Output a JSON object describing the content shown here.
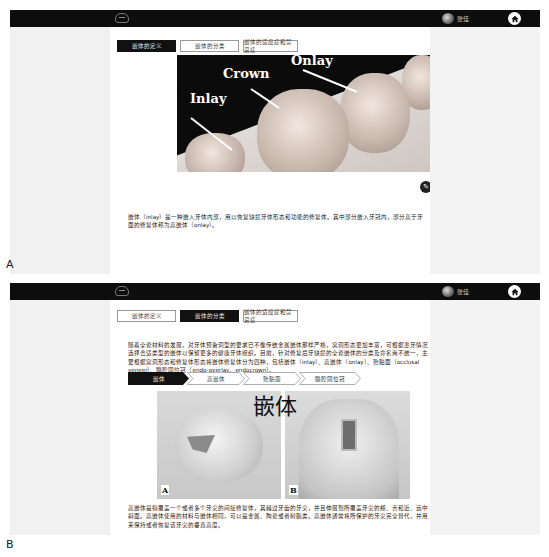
{
  "panels": [
    {
      "letter": "A",
      "header": {
        "user_name": "张佳",
        "logo": "tooth-logo-icon",
        "home": "home-icon"
      },
      "tabs": [
        {
          "label": "嵌体的定义",
          "active": true
        },
        {
          "label": "嵌体的分类",
          "active": false
        },
        {
          "label": "嵌体的适应症和禁忌症",
          "active": false
        }
      ],
      "image": {
        "labels": [
          "Inlay",
          "Crown",
          "Onlay"
        ]
      },
      "edit_icon": "pencil-icon",
      "paragraph": "嵌体（inlay）是一种嵌入牙体内部，用以恢复缺损牙体形态和功能的修复体。其中部分嵌入牙冠内，部分高于牙面的修复体称为高嵌体（onlay）。"
    },
    {
      "letter": "B",
      "header": {
        "user_name": "张佳",
        "logo": "tooth-logo-icon",
        "home": "home-icon"
      },
      "tabs": [
        {
          "label": "嵌体的定义",
          "active": false
        },
        {
          "label": "嵌体的分类",
          "active": true
        },
        {
          "label": "嵌体的适应症和禁忌症",
          "active": false
        }
      ],
      "intro": "随着全瓷材料的发展，对牙体预备洞型的要求已不像传统金属嵌体那样严格，窝洞形态更加丰富，可根据患牙情况选择合适类型的嵌体以保留更多的健康牙体组织。目前，针对修复后牙缺损的全瓷嵌体的分类及命名尚不统一，主要根据窝洞形态和修复体形态将嵌体修复体分为四种，包括嵌体（inlay）、高嵌体（onlay）、殆贴面（occlusal veneer）、髓腔固位冠（endo-overlay，endocrown）。",
      "steps": [
        {
          "label": "嵌体",
          "active": true
        },
        {
          "label": "高嵌体",
          "active": false
        },
        {
          "label": "殆贴面",
          "active": false
        },
        {
          "label": "髓腔固位冠",
          "active": false
        }
      ],
      "figure": {
        "title": "嵌体",
        "labels": [
          "A",
          "B"
        ]
      },
      "paragraph": "高嵌体是指覆盖一个或者多个牙尖的间接修复体，其越过牙齿的牙尖，并且伸展到所覆盖牙尖的颊、舌和近、远中斜面。高嵌体使用的材料与嵌体相同，可以是金属、陶瓷或者树脂类。高嵌体通常将所保护的牙尖完全替代，并用来保持或者恢复该牙尖的垂直高度。"
    }
  ]
}
